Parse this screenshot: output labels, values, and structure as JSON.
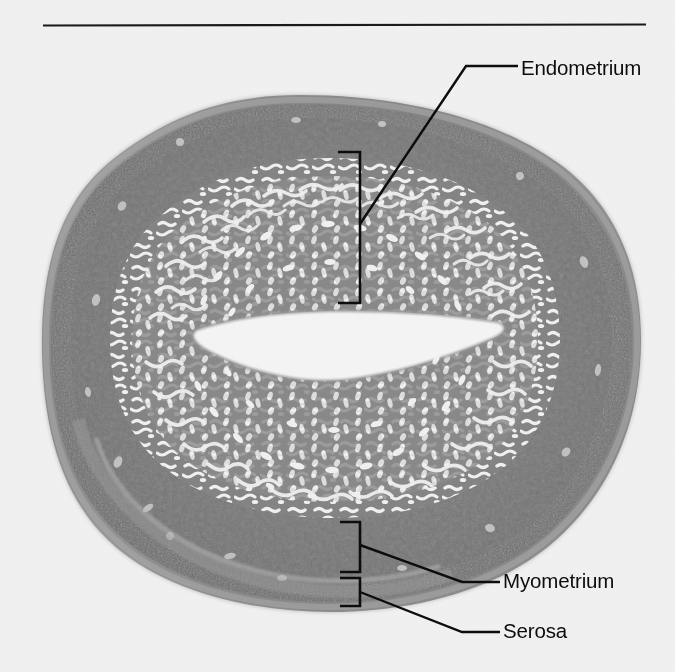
{
  "figure": {
    "kind": "histology-micrograph",
    "separator_rule": {
      "x1": 43,
      "x2": 646,
      "y": 25,
      "color": "#1a1a1a"
    },
    "background_color": "#f1f1f1",
    "tissue_colors": {
      "serosa_outer": "#9a9a9a",
      "myometrium_dark": "#6e6e6e",
      "myometrium_mid": "#7d7d7d",
      "endometrium_stroma": "#8a8a8a",
      "gland_lumen": "#f2f2f2",
      "uterine_cavity": "#f4f4f4",
      "ink": "#0d0d0d"
    }
  },
  "labels": [
    {
      "id": "endometrium",
      "text": "Endometrium",
      "text_x": 521,
      "text_y": 56,
      "bracket": {
        "x": 360,
        "y_top": 152,
        "y_bottom": 303,
        "tip_len": 22,
        "tip_dir": "left"
      },
      "leader": {
        "from_x": 360,
        "from_y": 224,
        "elbow_x": 466,
        "elbow_y": 66,
        "to_x": 518,
        "to_y": 66
      }
    },
    {
      "id": "myometrium",
      "text": "Myometrium",
      "text_x": 503,
      "text_y": 569,
      "bracket": {
        "x": 360,
        "y_top": 522,
        "y_bottom": 572,
        "tip_len": 20,
        "tip_dir": "left"
      },
      "leader": {
        "from_x": 360,
        "from_y": 545,
        "elbow_x": 462,
        "elbow_y": 582,
        "to_x": 500,
        "to_y": 582
      }
    },
    {
      "id": "serosa",
      "text": "Serosa",
      "text_x": 503,
      "text_y": 619,
      "bracket": {
        "x": 360,
        "y_top": 578,
        "y_bottom": 606,
        "tip_len": 20,
        "tip_dir": "left"
      },
      "leader": {
        "from_x": 360,
        "from_y": 592,
        "elbow_x": 462,
        "elbow_y": 632,
        "to_x": 500,
        "to_y": 632
      }
    }
  ],
  "specimen": {
    "outline_note": "rounded octagonal cross-section of uterine wall",
    "bounds": {
      "left": 42,
      "top": 95,
      "right": 641,
      "bottom": 612
    },
    "cavity_note": "horizontal slit-shaped uterine lumen near vertical center",
    "cavity_bounds": {
      "left": 190,
      "top": 300,
      "right": 510,
      "bottom": 382
    }
  }
}
